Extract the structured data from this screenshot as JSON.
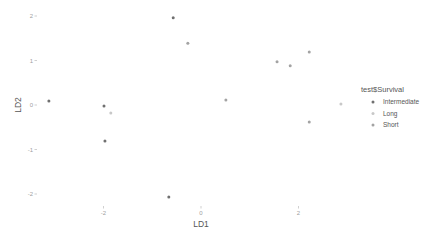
{
  "chart_data": {
    "type": "scatter",
    "title": "",
    "xlabel": "LD1",
    "ylabel": "LD2",
    "xlim": [
      -3.3,
      3.2
    ],
    "ylim": [
      -2.2,
      2.05
    ],
    "x_ticks": [
      -2,
      0,
      2
    ],
    "y_ticks": [
      -2,
      -1,
      0,
      1,
      2
    ],
    "grid": false,
    "legend": {
      "title": "test$Survival",
      "position": "right",
      "entries": [
        {
          "name": "Intermediate",
          "color": "#707070"
        },
        {
          "name": "Long",
          "color": "#c8c8c8"
        },
        {
          "name": "Short",
          "color": "#a3a3a3"
        }
      ]
    },
    "series": [
      {
        "name": "Intermediate",
        "color": "#707070",
        "points": [
          [
            -3.12,
            0.09
          ],
          [
            -1.99,
            -0.02
          ],
          [
            -1.97,
            -0.81
          ],
          [
            -0.57,
            1.96
          ],
          [
            -0.66,
            -2.07
          ]
        ]
      },
      {
        "name": "Long",
        "color": "#c8c8c8",
        "points": [
          [
            -1.85,
            -0.18
          ],
          [
            2.87,
            0.02
          ]
        ]
      },
      {
        "name": "Short",
        "color": "#a3a3a3",
        "points": [
          [
            -0.27,
            1.39
          ],
          [
            0.51,
            0.11
          ],
          [
            1.56,
            0.97
          ],
          [
            1.83,
            0.88
          ],
          [
            2.22,
            1.19
          ],
          [
            2.22,
            -0.38
          ]
        ]
      }
    ]
  }
}
